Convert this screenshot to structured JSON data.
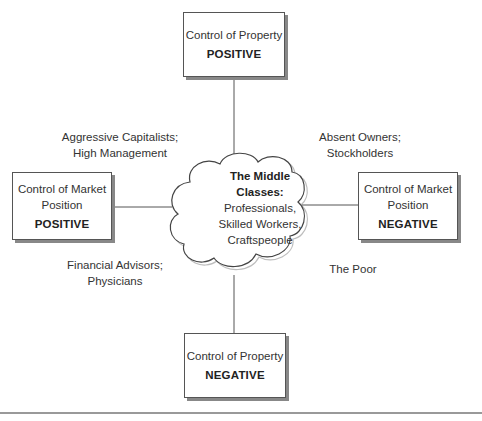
{
  "diagram": {
    "top_box": {
      "title": "Control of Property",
      "value": "POSITIVE"
    },
    "bottom_box": {
      "title": "Control of Property",
      "value": "NEGATIVE"
    },
    "left_box": {
      "title_line1": "Control of Market",
      "title_line2": "Position",
      "value": "POSITIVE"
    },
    "right_box": {
      "title_line1": "Control of Market",
      "title_line2": "Position",
      "value": "NEGATIVE"
    },
    "center": {
      "heading_line1": "The Middle",
      "heading_line2": "Classes:",
      "line1": "Professionals,",
      "line2": "Skilled Workers,",
      "line3": "Craftspeople"
    },
    "quadrants": {
      "top_left": {
        "line1": "Aggressive Capitalists;",
        "line2": "High Management"
      },
      "top_right": {
        "line1": "Absent Owners;",
        "line2": "Stockholders"
      },
      "bottom_left": {
        "line1": "Financial Advisors;",
        "line2": "Physicians"
      },
      "bottom_right": {
        "line1": "The Poor"
      }
    }
  }
}
